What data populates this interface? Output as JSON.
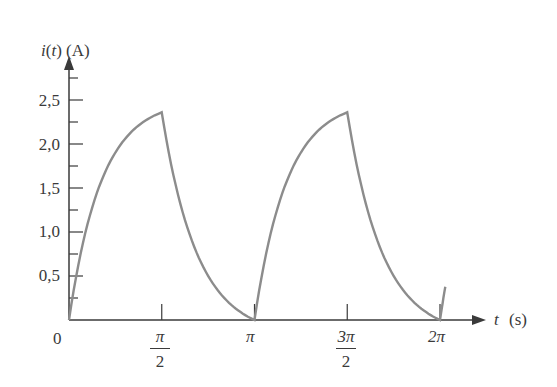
{
  "chart_data": {
    "type": "line",
    "title": "",
    "xlabel": "t (s)",
    "ylabel": "i(t) (A)",
    "x_tick_labels": [
      "0",
      "π/2",
      "π",
      "3π/2",
      "2π"
    ],
    "x_ticks": [
      0,
      1.5708,
      3.1416,
      4.7124,
      6.2832
    ],
    "y_tick_labels": [
      "0,5",
      "1,0",
      "1,5",
      "2,0",
      "2,5"
    ],
    "y_ticks": [
      0.5,
      1.0,
      1.5,
      2.0,
      2.5
    ],
    "ylim": [
      0,
      2.8
    ],
    "xlim": [
      0,
      6.6
    ],
    "grid": false,
    "legend": null,
    "series": [
      {
        "name": "i(t)",
        "description": "Periodic charge/discharge current: exponential rise from 0 to ~2.36 A over [0, π/2], exponential decay to 0 at π, repeating with period π",
        "x": [
          0,
          0.2,
          0.4,
          0.6,
          0.8,
          1.0,
          1.2,
          1.4,
          1.5708,
          1.8,
          2.0,
          2.2,
          2.4,
          2.6,
          2.8,
          3.0,
          3.1416,
          3.34,
          3.54,
          3.74,
          3.94,
          4.14,
          4.34,
          4.54,
          4.7124,
          4.94,
          5.14,
          5.34,
          5.54,
          5.74,
          5.94,
          6.14,
          6.2832,
          6.35
        ],
        "y": [
          0,
          0.78,
          1.3,
          1.66,
          1.9,
          2.07,
          2.2,
          2.3,
          2.36,
          1.55,
          1.1,
          0.76,
          0.5,
          0.3,
          0.15,
          0.04,
          0,
          0.78,
          1.3,
          1.66,
          1.9,
          2.07,
          2.2,
          2.3,
          2.36,
          1.55,
          1.1,
          0.76,
          0.5,
          0.3,
          0.15,
          0.04,
          0,
          0.22
        ]
      }
    ]
  },
  "labels": {
    "ylabel": "i(t) (A)",
    "xlabel_var": "t",
    "xlabel_unit": "(s)",
    "origin": "0",
    "y_ticks": [
      "2,5",
      "2,0",
      "1,5",
      "1,0",
      "0,5"
    ],
    "x_pi_half_num": "π",
    "x_pi_half_den": "2",
    "x_pi": "π",
    "x_3pi_half_num": "3π",
    "x_3pi_half_den": "2",
    "x_2pi": "2π"
  },
  "colors": {
    "axis": "#3a3a3a",
    "curve": "#8c8c8c"
  }
}
